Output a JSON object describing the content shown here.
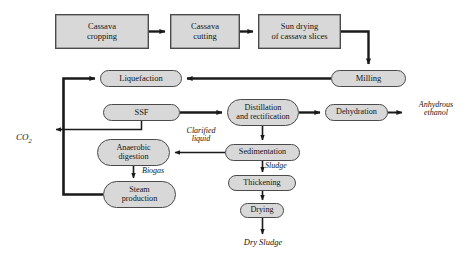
{
  "diagram": {
    "colors": {
      "node_fill": "#d8d8d8",
      "node_stroke": "#4a4a4a",
      "arrow": "#1a1a1a",
      "background": "#ffffff",
      "text": "#141414"
    },
    "nodes": [
      {
        "id": "cassava-cropping",
        "label": "Cassava\ncropping",
        "shape": "rect",
        "x": 55,
        "y": 14,
        "w": 94,
        "h": 35
      },
      {
        "id": "cassava-cutting",
        "label": "Cassava\ncutting",
        "shape": "rect",
        "x": 170,
        "y": 14,
        "w": 70,
        "h": 35
      },
      {
        "id": "sun-drying",
        "label": "Sun drying\nof cassava slices",
        "shape": "rect",
        "x": 258,
        "y": 14,
        "w": 83,
        "h": 35
      },
      {
        "id": "milling",
        "label": "Milling",
        "shape": "pill",
        "x": 331,
        "y": 70,
        "w": 75,
        "h": 16
      },
      {
        "id": "liquefaction",
        "label": "Liquefaction",
        "shape": "pill",
        "x": 100,
        "y": 70,
        "w": 82,
        "h": 17
      },
      {
        "id": "ssf",
        "label": "SSF",
        "shape": "pill",
        "x": 103,
        "y": 104,
        "w": 77,
        "h": 17
      },
      {
        "id": "distillation",
        "label": "Distillation\nand rectification",
        "shape": "pill",
        "x": 227,
        "y": 99,
        "w": 72,
        "h": 27
      },
      {
        "id": "dehydration",
        "label": "Dehydration",
        "shape": "pill",
        "x": 325,
        "y": 104,
        "w": 63,
        "h": 17
      },
      {
        "id": "sedimentation",
        "label": "Sedimentation",
        "shape": "pill",
        "x": 225,
        "y": 144,
        "w": 75,
        "h": 17
      },
      {
        "id": "anaerobic-digestion",
        "label": "Anaerobic\ndigestion",
        "shape": "pill",
        "x": 97,
        "y": 139,
        "w": 73,
        "h": 27
      },
      {
        "id": "steam-production",
        "label": "Steam\nproduction",
        "shape": "pill",
        "x": 103,
        "y": 181,
        "w": 73,
        "h": 27
      },
      {
        "id": "thickening",
        "label": "Thickening",
        "shape": "pill",
        "x": 228,
        "y": 175,
        "w": 68,
        "h": 16
      },
      {
        "id": "drying",
        "label": "Drying",
        "shape": "pill",
        "x": 240,
        "y": 203,
        "w": 44,
        "h": 15
      }
    ],
    "stream_labels": [
      {
        "id": "co2",
        "text": "CO2",
        "html": "CO<span class=\"sub\">2</span>",
        "x": 16,
        "y": 123,
        "w": 40,
        "align": "left"
      },
      {
        "id": "anhydrous-ethanol",
        "text": "Anhydrous\nethanol",
        "x": 404,
        "y": 101,
        "w": 64,
        "align": "center"
      },
      {
        "id": "clarified-liquid",
        "text": "Clarified\nliquid",
        "x": 175,
        "y": 127,
        "w": 52,
        "align": "center"
      },
      {
        "id": "biogas",
        "text": "Biogas",
        "x": 142,
        "y": 167,
        "w": 40,
        "align": "left"
      },
      {
        "id": "sludge",
        "text": "Sludge",
        "x": 265,
        "y": 162,
        "w": 40,
        "align": "left"
      },
      {
        "id": "dry-sludge",
        "text": "Dry Sludge",
        "x": 232,
        "y": 238,
        "w": 62,
        "align": "center"
      }
    ],
    "connections": [
      {
        "id": "cropping-to-cutting",
        "from": "cassava-cropping",
        "to": "cassava-cutting"
      },
      {
        "id": "cutting-to-sun-drying",
        "from": "cassava-cutting",
        "to": "sun-drying"
      },
      {
        "id": "sun-drying-to-milling",
        "from": "sun-drying",
        "to": "milling"
      },
      {
        "id": "milling-to-liquefaction",
        "from": "milling",
        "to": "liquefaction"
      },
      {
        "id": "ssf-to-distillation",
        "from": "ssf",
        "to": "distillation"
      },
      {
        "id": "distillation-to-dehydration",
        "from": "distillation",
        "to": "dehydration"
      },
      {
        "id": "dehydration-to-ethanol",
        "from": "dehydration",
        "to": "anhydrous-ethanol"
      },
      {
        "id": "distillation-to-sedimentation",
        "from": "distillation",
        "to": "sedimentation"
      },
      {
        "id": "sedimentation-to-anaerobic",
        "from": "sedimentation",
        "to": "anaerobic-digestion",
        "label": "Clarified liquid"
      },
      {
        "id": "anaerobic-to-steam",
        "from": "anaerobic-digestion",
        "to": "steam-production",
        "label": "Biogas"
      },
      {
        "id": "steam-to-liquefaction",
        "from": "steam-production",
        "to": "liquefaction"
      },
      {
        "id": "ssf-to-co2",
        "from": "ssf",
        "to": "co2"
      },
      {
        "id": "sedimentation-to-thickening",
        "from": "sedimentation",
        "to": "thickening",
        "label": "Sludge"
      },
      {
        "id": "thickening-to-drying",
        "from": "thickening",
        "to": "drying"
      },
      {
        "id": "drying-to-dry-sludge",
        "from": "drying",
        "to": "dry-sludge"
      }
    ]
  }
}
